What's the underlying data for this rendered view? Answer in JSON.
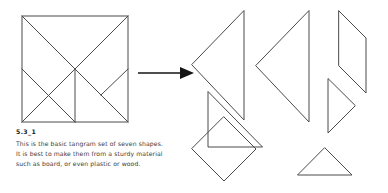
{
  "figure": {
    "caption_title": "5.3_1",
    "caption_body": "This is the basic tangram set of seven shapes. It is best to make them from a sturdy material such as board, or even plastic or wood.",
    "stroke_color": "#4a4a4a",
    "arrow_color": "#151515",
    "background_color": "#ffffff",
    "piece_count": 7
  },
  "assembled": {
    "label": "assembled-tangram-square",
    "square": {
      "x": 22,
      "y": 16,
      "width": 106,
      "height": 106
    }
  },
  "arrow": {
    "label": "transformation-arrow",
    "direction": "right"
  },
  "pieces": [
    {
      "name": "large-triangle-1",
      "shape": "triangle",
      "orientation": "points-left"
    },
    {
      "name": "large-triangle-2",
      "shape": "triangle",
      "orientation": "points-left"
    },
    {
      "name": "parallelogram",
      "shape": "parallelogram",
      "orientation": "leaning-right"
    },
    {
      "name": "medium-triangle",
      "shape": "triangle",
      "orientation": "points-right"
    },
    {
      "name": "small-triangle-1",
      "shape": "triangle",
      "orientation": "right-angle-bottom-left"
    },
    {
      "name": "square",
      "shape": "square",
      "orientation": "diamond"
    },
    {
      "name": "small-triangle-2",
      "shape": "triangle",
      "orientation": "points-up"
    }
  ]
}
